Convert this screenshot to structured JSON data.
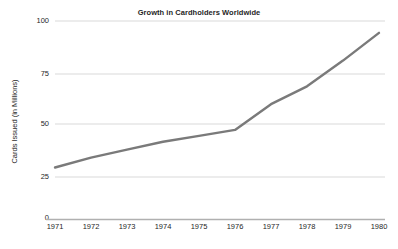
{
  "chart_data": {
    "type": "line",
    "title": "Growth in Cardholders Worldwide",
    "xlabel": "",
    "ylabel": "Cards Issued (in Millions)",
    "categories": [
      "1971",
      "1972",
      "1973",
      "1974",
      "1975",
      "1976",
      "1977",
      "1978",
      "1979",
      "1980"
    ],
    "x": [
      1971,
      1972,
      1973,
      1974,
      1975,
      1976,
      1977,
      1978,
      1979,
      1980
    ],
    "values": [
      26,
      31,
      35,
      39,
      42,
      45,
      58,
      67,
      80,
      94
    ],
    "series": [
      {
        "name": "Cards Issued",
        "values": [
          26,
          31,
          35,
          39,
          42,
          45,
          58,
          67,
          80,
          94
        ]
      }
    ],
    "ylim": [
      0,
      100
    ],
    "xlim": [
      1971,
      1980
    ],
    "y_ticks": [
      0,
      25,
      50,
      75,
      100
    ],
    "y_tick_labels": [
      "0",
      "25",
      "50",
      "75",
      "100"
    ],
    "x_tick_labels": [
      "1971",
      "1972",
      "1973",
      "1974",
      "1975",
      "1976",
      "1977",
      "1978",
      "1979",
      "1980"
    ],
    "grid": "horizontal",
    "legend": "none",
    "line_color": "#7a7a7a",
    "grid_color": "#d9d9d9",
    "axis_color": "#b0b0b0",
    "text_color": "#1f1f1f",
    "background_color": "#ffffff"
  }
}
